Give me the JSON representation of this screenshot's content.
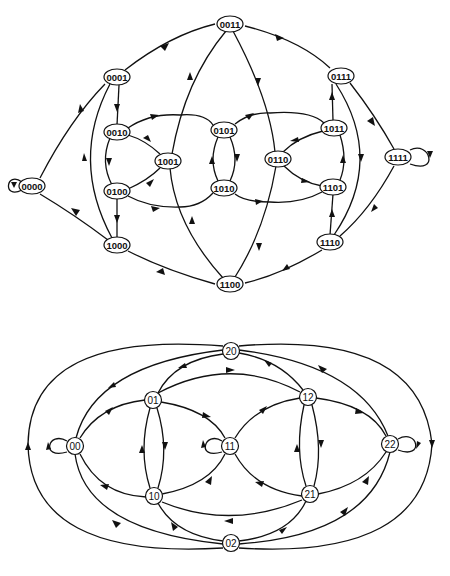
{
  "diagrams": [
    {
      "name": "binary-de-bruijn-graph-n4",
      "nodes": [
        {
          "id": "0000",
          "label": "0000",
          "x": 32,
          "y": 186
        },
        {
          "id": "0001",
          "label": "0001",
          "x": 117,
          "y": 77
        },
        {
          "id": "0011",
          "label": "0011",
          "x": 230,
          "y": 24
        },
        {
          "id": "0111",
          "label": "0111",
          "x": 341,
          "y": 76
        },
        {
          "id": "1111",
          "label": "1111",
          "x": 398,
          "y": 157
        },
        {
          "id": "0010",
          "label": "0010",
          "x": 117,
          "y": 132
        },
        {
          "id": "0100",
          "label": "0100",
          "x": 117,
          "y": 191
        },
        {
          "id": "1000",
          "label": "1000",
          "x": 117,
          "y": 245
        },
        {
          "id": "1001",
          "label": "1001",
          "x": 168,
          "y": 161
        },
        {
          "id": "0101",
          "label": "0101",
          "x": 224,
          "y": 130
        },
        {
          "id": "1010",
          "label": "1010",
          "x": 224,
          "y": 188
        },
        {
          "id": "0110",
          "label": "0110",
          "x": 278,
          "y": 159
        },
        {
          "id": "1011",
          "label": "1011",
          "x": 334,
          "y": 128
        },
        {
          "id": "1101",
          "label": "1101",
          "x": 333,
          "y": 187
        },
        {
          "id": "1110",
          "label": "1110",
          "x": 330,
          "y": 242
        },
        {
          "id": "1100",
          "label": "1100",
          "x": 230,
          "y": 284
        }
      ]
    },
    {
      "name": "ternary-de-bruijn-graph-n2",
      "nodes": [
        {
          "id": "20",
          "label": "20",
          "x": 231,
          "y": 351
        },
        {
          "id": "01",
          "label": "01",
          "x": 153,
          "y": 400
        },
        {
          "id": "12",
          "label": "12",
          "x": 308,
          "y": 397
        },
        {
          "id": "00",
          "label": "00",
          "x": 75,
          "y": 446
        },
        {
          "id": "11",
          "label": "11",
          "x": 230,
          "y": 446
        },
        {
          "id": "22",
          "label": "22",
          "x": 390,
          "y": 444
        },
        {
          "id": "10",
          "label": "10",
          "x": 154,
          "y": 496
        },
        {
          "id": "21",
          "label": "21",
          "x": 310,
          "y": 494
        },
        {
          "id": "02",
          "label": "02",
          "x": 231,
          "y": 543
        }
      ]
    }
  ]
}
